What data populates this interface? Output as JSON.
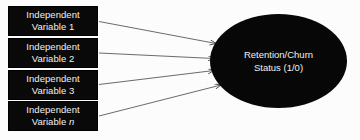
{
  "diagram": {
    "type": "predictor-outcome-diagram",
    "background_color": "#ffffff",
    "node_fill_color": "#0a0a0a",
    "node_text_color": "#f2f2f2",
    "arrow_color": "#555555",
    "predictors": [
      {
        "line1": "Independent",
        "line2": "Variable 1",
        "label": "Independent Variable 1"
      },
      {
        "line1": "Independent",
        "line2": "Variable 2",
        "label": "Independent Variable 2"
      },
      {
        "line1": "Independent",
        "line2": "Variable 3",
        "label": "Independent Variable 3"
      },
      {
        "line1": "Independent",
        "line2_prefix": "Variable ",
        "line2_italic": "n",
        "label": "Independent Variable n"
      }
    ],
    "outcome": {
      "line1": "Retention/Churn",
      "line2": "Status (1/0)",
      "label": "Retention/Churn Status (1/0)"
    },
    "arrows": [
      {
        "from": "Independent Variable 1",
        "to": "Retention/Churn Status (1/0)"
      },
      {
        "from": "Independent Variable 2",
        "to": "Retention/Churn Status (1/0)"
      },
      {
        "from": "Independent Variable 3",
        "to": "Retention/Churn Status (1/0)"
      },
      {
        "from": "Independent Variable n",
        "to": "Retention/Churn Status (1/0)"
      }
    ]
  }
}
